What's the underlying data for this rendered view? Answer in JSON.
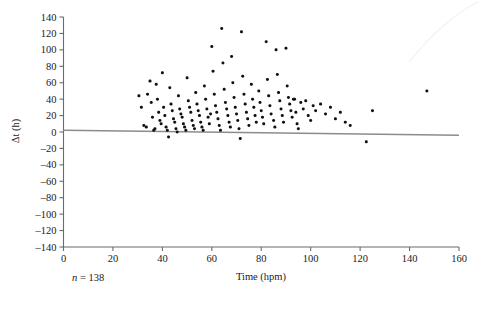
{
  "chart_data": {
    "type": "scatter",
    "title": "",
    "xlabel": "Time (hpm)",
    "ylabel": "Δt (h)",
    "xlim": [
      0,
      160
    ],
    "ylim": [
      -140,
      140
    ],
    "xticks": [
      0,
      20,
      40,
      60,
      80,
      100,
      120,
      140,
      160
    ],
    "yticks": [
      140,
      120,
      100,
      80,
      60,
      40,
      20,
      0,
      -20,
      -40,
      -60,
      -80,
      -100,
      -120,
      -140
    ],
    "xtick_labels": [
      "0",
      "20",
      "40",
      "60",
      "80",
      "100",
      "120",
      "140",
      "160"
    ],
    "ytick_labels": [
      "140",
      "120",
      "100",
      "80",
      "60",
      "40",
      "20",
      "0",
      "–20",
      "–40",
      "–60",
      "–80",
      "–100",
      "–120",
      "–140"
    ],
    "grid": false,
    "legend": null,
    "annotations": [
      {
        "name": "sample-size",
        "text_italic": "n",
        "text": " = 138",
        "full_text": "n = 138"
      }
    ],
    "trend_line": {
      "name": "regression-line",
      "x_start": 0,
      "y_start": 2,
      "x_end": 160,
      "y_end": -4,
      "color": "#8c8c8c"
    },
    "point_color": "#111111",
    "series": [
      {
        "name": "delta-t-observations",
        "n": 138,
        "points": [
          [
            30.5,
            44
          ],
          [
            31.5,
            30
          ],
          [
            32.5,
            8
          ],
          [
            33.5,
            6
          ],
          [
            34.0,
            46
          ],
          [
            35.0,
            62
          ],
          [
            35.5,
            36
          ],
          [
            36.0,
            18
          ],
          [
            36.5,
            2
          ],
          [
            37.0,
            4
          ],
          [
            37.5,
            58
          ],
          [
            38.0,
            40
          ],
          [
            38.5,
            24
          ],
          [
            39.0,
            14
          ],
          [
            39.5,
            10
          ],
          [
            40.0,
            72
          ],
          [
            40.5,
            30
          ],
          [
            41.0,
            20
          ],
          [
            41.5,
            6
          ],
          [
            42.0,
            2
          ],
          [
            42.5,
            -6
          ],
          [
            43.0,
            54
          ],
          [
            43.5,
            34
          ],
          [
            44.0,
            26
          ],
          [
            44.5,
            16
          ],
          [
            45.0,
            12
          ],
          [
            45.5,
            4
          ],
          [
            46.0,
            0
          ],
          [
            46.5,
            44
          ],
          [
            47.0,
            28
          ],
          [
            47.5,
            22
          ],
          [
            48.0,
            18
          ],
          [
            48.5,
            10
          ],
          [
            49.0,
            6
          ],
          [
            49.5,
            2
          ],
          [
            50.0,
            66
          ],
          [
            50.5,
            38
          ],
          [
            51.0,
            30
          ],
          [
            51.5,
            24
          ],
          [
            52.0,
            14
          ],
          [
            52.5,
            8
          ],
          [
            53.0,
            4
          ],
          [
            53.5,
            48
          ],
          [
            54.0,
            34
          ],
          [
            54.5,
            26
          ],
          [
            55.0,
            20
          ],
          [
            55.5,
            12
          ],
          [
            56.0,
            6
          ],
          [
            56.5,
            2
          ],
          [
            57.0,
            56
          ],
          [
            57.5,
            40
          ],
          [
            58.0,
            28
          ],
          [
            58.5,
            18
          ],
          [
            59.0,
            10
          ],
          [
            59.5,
            22
          ],
          [
            60.0,
            104
          ],
          [
            60.5,
            74
          ],
          [
            61.0,
            46
          ],
          [
            61.5,
            32
          ],
          [
            62.0,
            24
          ],
          [
            62.5,
            16
          ],
          [
            63.0,
            8
          ],
          [
            63.5,
            2
          ],
          [
            64.0,
            126
          ],
          [
            64.5,
            84
          ],
          [
            65.0,
            52
          ],
          [
            65.5,
            36
          ],
          [
            66.0,
            28
          ],
          [
            66.5,
            20
          ],
          [
            67.0,
            12
          ],
          [
            67.5,
            6
          ],
          [
            68.0,
            92
          ],
          [
            68.5,
            60
          ],
          [
            69.0,
            42
          ],
          [
            69.5,
            30
          ],
          [
            70.0,
            22
          ],
          [
            70.5,
            14
          ],
          [
            71.0,
            4
          ],
          [
            71.5,
            -8
          ],
          [
            72.0,
            122
          ],
          [
            72.5,
            68
          ],
          [
            73.0,
            46
          ],
          [
            73.5,
            34
          ],
          [
            74.0,
            24
          ],
          [
            74.5,
            16
          ],
          [
            75.0,
            8
          ],
          [
            76.0,
            58
          ],
          [
            76.5,
            40
          ],
          [
            77.0,
            30
          ],
          [
            77.5,
            20
          ],
          [
            78.0,
            12
          ],
          [
            79.0,
            50
          ],
          [
            79.5,
            36
          ],
          [
            80.0,
            26
          ],
          [
            80.5,
            18
          ],
          [
            81.0,
            10
          ],
          [
            82.0,
            110
          ],
          [
            82.5,
            64
          ],
          [
            83.0,
            44
          ],
          [
            83.5,
            32
          ],
          [
            84.0,
            22
          ],
          [
            85.0,
            14
          ],
          [
            85.5,
            6
          ],
          [
            86.0,
            100
          ],
          [
            86.5,
            70
          ],
          [
            87.0,
            48
          ],
          [
            87.5,
            38
          ],
          [
            88.0,
            28
          ],
          [
            88.5,
            20
          ],
          [
            89.0,
            12
          ],
          [
            90.0,
            102
          ],
          [
            90.5,
            56
          ],
          [
            91.0,
            42
          ],
          [
            91.5,
            34
          ],
          [
            92.0,
            26
          ],
          [
            92.5,
            18
          ],
          [
            93.0,
            40
          ],
          [
            93.5,
            40
          ],
          [
            94.0,
            24
          ],
          [
            94.5,
            10
          ],
          [
            95.0,
            4
          ],
          [
            96.0,
            36
          ],
          [
            97.0,
            28
          ],
          [
            98.0,
            38
          ],
          [
            99.0,
            20
          ],
          [
            100.0,
            14
          ],
          [
            101.0,
            32
          ],
          [
            102.0,
            26
          ],
          [
            104.0,
            34
          ],
          [
            106.0,
            22
          ],
          [
            108.0,
            30
          ],
          [
            110.0,
            16
          ],
          [
            112.0,
            24
          ],
          [
            114.0,
            12
          ],
          [
            116.0,
            8
          ],
          [
            122.5,
            -12
          ],
          [
            125.0,
            26
          ],
          [
            147.0,
            50
          ]
        ]
      }
    ]
  },
  "axes": {
    "y_axis_label": "Δt (h)",
    "x_axis_label": "Time (hpm)"
  }
}
